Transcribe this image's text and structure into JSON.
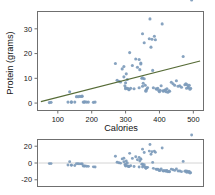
{
  "figure": {
    "width": 215,
    "height": 195,
    "background": "#ffffff"
  },
  "colors": {
    "point": "#7d9bbb",
    "fit_line": "#566b36",
    "frame": "#6f6f6f",
    "zero_line": "#c9c9c9",
    "text": "#141414"
  },
  "chart_data": [
    {
      "type": "scatter",
      "name": "protein-vs-calories",
      "title": "",
      "xlabel": "Calories",
      "ylabel": "Protein (grams)",
      "xlim": [
        40,
        530
      ],
      "ylim": [
        -3,
        37
      ],
      "xticks": [
        100,
        200,
        300,
        400,
        500
      ],
      "xticklabels": [
        "100",
        "200",
        "300",
        "400",
        "500"
      ],
      "yticks": [
        0,
        10,
        20,
        30
      ],
      "yticklabels": [
        "0",
        "10",
        "20",
        "30"
      ],
      "grid": false,
      "legend": "none",
      "fit_line": {
        "type": "linear-regression",
        "x": [
          50,
          520
        ],
        "y": [
          0.6,
          17.0
        ],
        "color": "#566b36"
      },
      "x": [
        75,
        80,
        130,
        135,
        140,
        140,
        150,
        155,
        160,
        165,
        170,
        172,
        175,
        178,
        180,
        185,
        190,
        205,
        210,
        270,
        275,
        280,
        285,
        290,
        295,
        295,
        298,
        300,
        300,
        300,
        302,
        305,
        305,
        308,
        310,
        310,
        312,
        315,
        320,
        325,
        330,
        335,
        340,
        340,
        342,
        345,
        345,
        348,
        350,
        350,
        350,
        352,
        355,
        355,
        358,
        360,
        360,
        362,
        365,
        370,
        372,
        375,
        378,
        380,
        382,
        385,
        388,
        390,
        392,
        395,
        398,
        400,
        402,
        405,
        408,
        410,
        412,
        415,
        418,
        420,
        422,
        425,
        428,
        430,
        435,
        440,
        445,
        450,
        455,
        460,
        465,
        470,
        475,
        478,
        480,
        482,
        485,
        485,
        488,
        490,
        492,
        495
      ],
      "y": [
        0.2,
        0.3,
        0.4,
        4.6,
        0.3,
        0.5,
        0.4,
        2.6,
        2.6,
        2.7,
        2.7,
        2.8,
        0.4,
        0.4,
        0.5,
        0.4,
        0.4,
        0.3,
        0.4,
        16.0,
        9.2,
        8.8,
        8.5,
        13.8,
        14.8,
        10.6,
        7.0,
        8.2,
        6.2,
        5.8,
        11.8,
        9.5,
        6.0,
        5.8,
        5.6,
        5.4,
        20.4,
        6.0,
        15.2,
        5.8,
        17.8,
        14.5,
        17.6,
        6.2,
        13.5,
        16.2,
        15.8,
        10.0,
        28.0,
        10.2,
        6.8,
        8.0,
        24.4,
        9.8,
        7.2,
        4.8,
        5.2,
        5.6,
        6.2,
        26.0,
        34.0,
        22.6,
        25.8,
        13.2,
        6.2,
        27.0,
        25.6,
        5.8,
        5.6,
        6.0,
        5.0,
        4.6,
        5.2,
        7.0,
        32.0,
        5.0,
        4.8,
        5.2,
        5.4,
        4.6,
        5.8,
        4.4,
        5.0,
        4.8,
        8.4,
        7.8,
        7.2,
        9.0,
        6.8,
        7.0,
        6.4,
        18.8,
        7.4,
        7.8,
        6.0,
        7.4,
        6.6,
        6.2,
        7.2,
        5.6,
        6.0
      ]
    },
    {
      "type": "scatter",
      "name": "residual-plot",
      "title": "",
      "xlabel": "",
      "ylabel": "",
      "xlim": [
        40,
        530
      ],
      "ylim": [
        -28,
        28
      ],
      "xticks": [],
      "xticklabels": [],
      "yticks": [
        -20,
        0,
        20
      ],
      "yticklabels": [
        "-20",
        "0",
        "20"
      ],
      "grid": false,
      "legend": "none",
      "zero_reference": 0,
      "x": [
        75,
        80,
        130,
        135,
        140,
        140,
        150,
        155,
        160,
        165,
        170,
        172,
        175,
        178,
        180,
        185,
        190,
        205,
        210,
        270,
        275,
        280,
        285,
        290,
        295,
        295,
        298,
        300,
        300,
        300,
        302,
        305,
        305,
        308,
        310,
        310,
        312,
        315,
        320,
        325,
        330,
        335,
        340,
        340,
        342,
        345,
        345,
        348,
        350,
        350,
        350,
        352,
        355,
        355,
        358,
        360,
        360,
        362,
        365,
        370,
        372,
        375,
        378,
        380,
        382,
        385,
        388,
        390,
        392,
        395,
        398,
        400,
        402,
        405,
        408,
        410,
        412,
        415,
        418,
        420,
        422,
        425,
        428,
        430,
        435,
        440,
        445,
        450,
        455,
        460,
        465,
        470,
        475,
        478,
        480,
        482,
        485,
        485,
        488,
        490,
        492,
        495
      ],
      "y": [
        -0.7,
        -0.7,
        -2.4,
        1.6,
        -2.7,
        -2.5,
        -2.9,
        -0.8,
        -0.9,
        -1.0,
        -1.1,
        -1.1,
        -3.6,
        -3.7,
        -3.6,
        -3.8,
        -4.0,
        -4.6,
        -4.7,
        8.0,
        0.9,
        0.3,
        -0.2,
        4.9,
        5.7,
        1.5,
        -2.2,
        -1.1,
        -3.1,
        -3.5,
        2.4,
        0.0,
        -3.5,
        -3.8,
        -4.1,
        -4.3,
        11.5,
        -3.3,
        5.5,
        -4.2,
        7.4,
        3.9,
        6.7,
        -4.7,
        2.4,
        4.9,
        4.5,
        -1.4,
        16.5,
        -1.3,
        -4.7,
        -3.6,
        12.6,
        -2.0,
        -4.7,
        -6.3,
        -5.9,
        -5.6,
        -5.2,
        14.2,
        22.0,
        10.4,
        13.4,
        0.7,
        -6.4,
        14.2,
        12.7,
        -7.3,
        -7.6,
        -7.3,
        -8.4,
        -9.1,
        -8.6,
        -7.0,
        17.8,
        -9.2,
        -9.5,
        -9.2,
        -9.1,
        -10.0,
        -9.0,
        -10.5,
        -10.0,
        -10.4,
        -7.3,
        -8.0,
        -8.8,
        -7.2,
        -9.6,
        -9.5,
        -10.3,
        1.9,
        -9.8,
        -9.5,
        -11.0,
        -9.7,
        -10.6,
        -11.1,
        -10.2,
        -12.0,
        -11.7
      ]
    }
  ]
}
